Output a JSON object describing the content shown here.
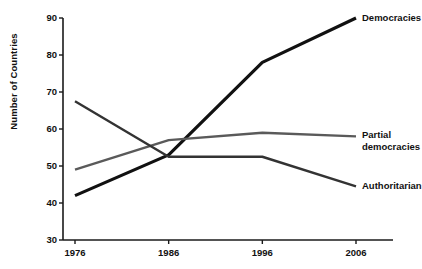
{
  "chart_data": {
    "type": "line",
    "title": "",
    "subtitle": "",
    "xlabel": "",
    "ylabel": "Number of Countries",
    "x": [
      1976,
      1986,
      1996,
      2006
    ],
    "categories": [
      "1976",
      "1986",
      "1996",
      "2006"
    ],
    "xlim": [
      1976,
      2006
    ],
    "ylim": [
      30,
      90
    ],
    "yticks": [
      30,
      40,
      50,
      60,
      70,
      80,
      90
    ],
    "ytick_labels": [
      "30",
      "40",
      "50",
      "60",
      "70",
      "80",
      "90"
    ],
    "xticks": [
      1976,
      1986,
      1996,
      2006
    ],
    "xtick_labels": [
      "1976",
      "1986",
      "1996",
      "2006"
    ],
    "grid": false,
    "legend_position": "right-inline-labels",
    "series": [
      {
        "name": "Democracies",
        "color": "#111111",
        "width": 3.2,
        "values": [
          42,
          53,
          78,
          90
        ]
      },
      {
        "name": "Partial democracies",
        "color": "#5a5a5a",
        "width": 2.4,
        "values": [
          49,
          57,
          59,
          58
        ]
      },
      {
        "name": "Authoritarian",
        "color": "#333333",
        "width": 2.4,
        "values": [
          67.5,
          52.5,
          52.5,
          44.5
        ]
      }
    ],
    "annotations": [
      {
        "text": "Democracies",
        "series": "Democracies",
        "at_x": 2006,
        "at_y": 90
      },
      {
        "text": "Partial",
        "series": "Partial democracies",
        "at_x": 2006,
        "at_y": 58
      },
      {
        "text": "democracies",
        "series": "Partial democracies",
        "at_x": 2006,
        "at_y": 58
      },
      {
        "text": "Authoritarian",
        "series": "Authoritarian",
        "at_x": 2006,
        "at_y": 44.5
      }
    ]
  },
  "axes": {
    "y_title": "Number of Countries",
    "y_ticks": [
      "90",
      "80",
      "70",
      "60",
      "50",
      "40",
      "30"
    ],
    "x_ticks": [
      "1976",
      "1986",
      "1996",
      "2006"
    ],
    "axis_color": "#1a1a1a"
  },
  "labels": {
    "democracies": "Democracies",
    "partial_line1": "Partial",
    "partial_line2": "democracies",
    "authoritarian": "Authoritarian"
  }
}
